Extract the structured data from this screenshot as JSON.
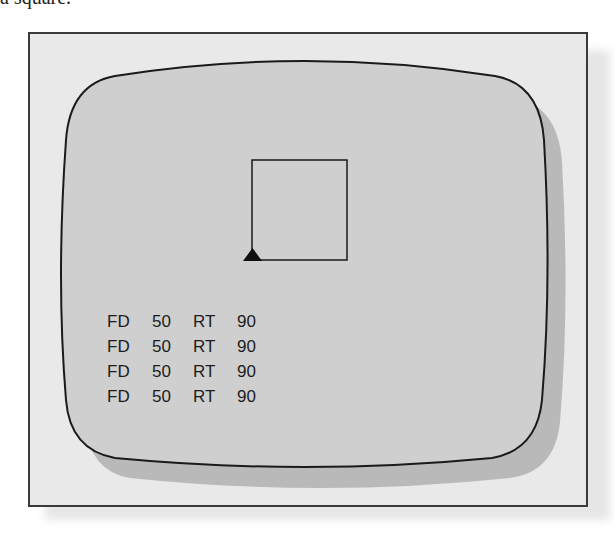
{
  "caption_fragment": "a square.",
  "colors": {
    "frame_bg": "#e9e9e9",
    "screen_bg": "#cfcfcf",
    "screen_shadow": "#b9b9b9",
    "line": "#1a1a1a"
  },
  "drawing": {
    "shape": "square",
    "turtle": "triangle"
  },
  "commands": [
    {
      "cmd": "FD",
      "arg1": "50",
      "turn": "RT",
      "arg2": "90"
    },
    {
      "cmd": "FD",
      "arg1": "50",
      "turn": "RT",
      "arg2": "90"
    },
    {
      "cmd": "FD",
      "arg1": "50",
      "turn": "RT",
      "arg2": "90"
    },
    {
      "cmd": "FD",
      "arg1": "50",
      "turn": "RT",
      "arg2": "90"
    }
  ]
}
